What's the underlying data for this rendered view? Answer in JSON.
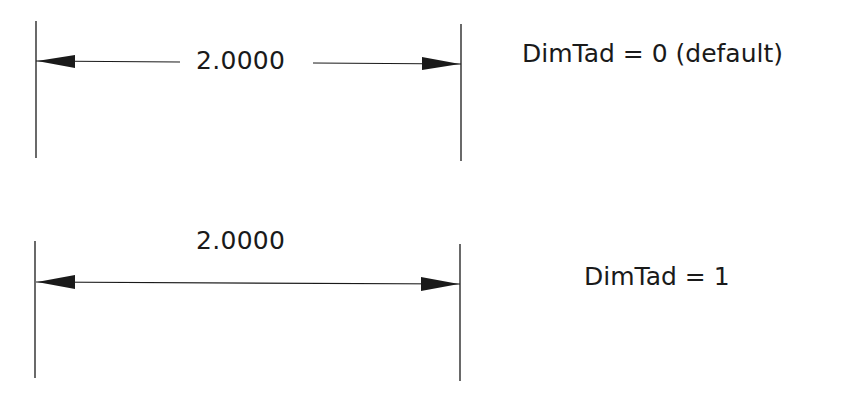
{
  "diagram": {
    "examples": [
      {
        "dimension_value": "2.0000",
        "setting_label": "DimTad = 0 (default)",
        "text_position": "centered-in-line"
      },
      {
        "dimension_value": "2.0000",
        "setting_label": "DimTad = 1",
        "text_position": "above-line"
      }
    ],
    "colors": {
      "line": "#1a1a1a",
      "background": "#ffffff"
    }
  }
}
